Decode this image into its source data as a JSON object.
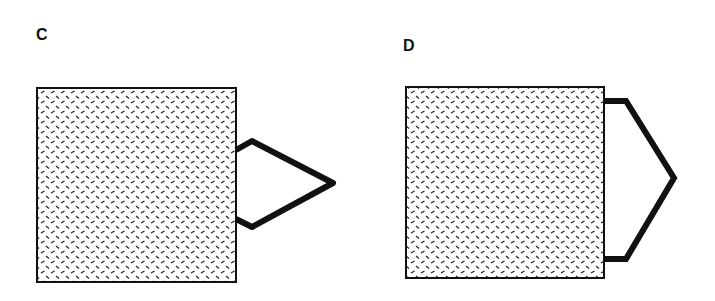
{
  "panels": [
    {
      "label": "C",
      "description": "Hatched square with triangular loop attached to right side"
    },
    {
      "label": "D",
      "description": "Hatched square with wide pointed loop attached to right side"
    }
  ],
  "colors": {
    "stroke": "#111111",
    "background": "#ffffff"
  }
}
